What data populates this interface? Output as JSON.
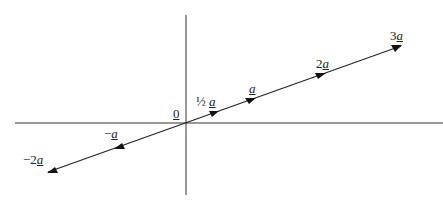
{
  "diagram": {
    "origin_label": "0",
    "labels": [
      {
        "id": "half",
        "coef": "½",
        "vec": "a",
        "x": 196,
        "y": 95
      },
      {
        "id": "one",
        "coef": "",
        "vec": "a",
        "x": 249,
        "y": 82
      },
      {
        "id": "two",
        "coef": "2",
        "vec": "a",
        "x": 316,
        "y": 57
      },
      {
        "id": "three",
        "coef": "3",
        "vec": "a",
        "x": 390,
        "y": 29
      },
      {
        "id": "minus-one",
        "coef": "−",
        "vec": "a",
        "x": 104,
        "y": 127
      },
      {
        "id": "minus-two",
        "coef": "−2",
        "vec": "a",
        "x": 23,
        "y": 153
      }
    ]
  }
}
